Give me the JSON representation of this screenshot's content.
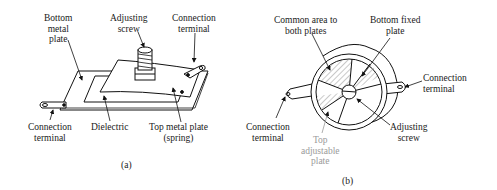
{
  "figure_a": {
    "caption": "(a)",
    "labels": {
      "bottom_metal_plate": [
        "Bottom",
        "metal",
        "plate"
      ],
      "adjusting_screw": [
        "Adjusting",
        "screw"
      ],
      "connection_terminal_top": [
        "Connection",
        "terminal"
      ],
      "connection_terminal_left": [
        "Connection",
        "terminal"
      ],
      "dielectric": [
        "Dielectric"
      ],
      "top_metal_plate": [
        "Top metal plate",
        "(spring)"
      ]
    }
  },
  "figure_b": {
    "caption": "(b)",
    "labels": {
      "common_area": [
        "Common area to",
        "both plates"
      ],
      "bottom_fixed_plate": [
        "Bottom fixed",
        "plate"
      ],
      "connection_terminal_right": [
        "Connection",
        "terminal"
      ],
      "connection_terminal_left": [
        "Connection",
        "terminal"
      ],
      "adjusting_screw": [
        "Adjusting",
        "screw"
      ],
      "top_adjustable_plate": [
        "Top",
        "adjustable",
        "plate"
      ]
    }
  }
}
